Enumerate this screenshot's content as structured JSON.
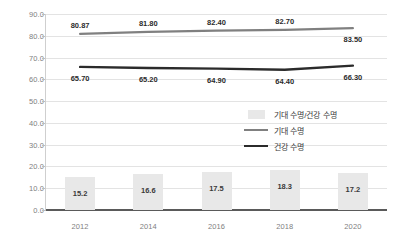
{
  "chart_data": {
    "type": "bar",
    "title": "",
    "xlabel": "",
    "ylabel": "",
    "categories": [
      "2012",
      "2014",
      "2016",
      "2018",
      "2020"
    ],
    "ylim": [
      0,
      90
    ],
    "ytick_step": 10,
    "yticks": [
      "0.0",
      "10.0",
      "20.0",
      "30.0",
      "40.0",
      "50.0",
      "60.0",
      "70.0",
      "80.0",
      "90.0"
    ],
    "grid": true,
    "legend_position": "center-right",
    "series": [
      {
        "name": "기대 수명/건강 수명",
        "render": "bar",
        "color": "#e8e8e8",
        "values": [
          15.2,
          16.6,
          17.5,
          18.3,
          17.2
        ],
        "labels": [
          "15.2",
          "16.6",
          "17.5",
          "18.3",
          "17.2"
        ]
      },
      {
        "name": "기대 수명",
        "render": "line",
        "color": "#808080",
        "values": [
          80.87,
          81.8,
          82.4,
          82.7,
          83.5
        ],
        "labels": [
          "80.87",
          "81.80",
          "82.40",
          "82.70",
          "83.50"
        ]
      },
      {
        "name": "건강 수명",
        "render": "line",
        "color": "#2b2b2b",
        "values": [
          65.7,
          65.2,
          64.9,
          64.4,
          66.3
        ],
        "labels": [
          "65.70",
          "65.20",
          "64.90",
          "64.40",
          "66.30"
        ]
      }
    ]
  },
  "legend": {
    "items": [
      {
        "label": "기대 수명/건강 수명",
        "key": "swatch-box",
        "color": "#e8e8e8"
      },
      {
        "label": "기대 수명",
        "key": "swatch-line-gray",
        "color": "#808080"
      },
      {
        "label": "건강 수명",
        "key": "swatch-line-black",
        "color": "#2b2b2b"
      }
    ]
  }
}
